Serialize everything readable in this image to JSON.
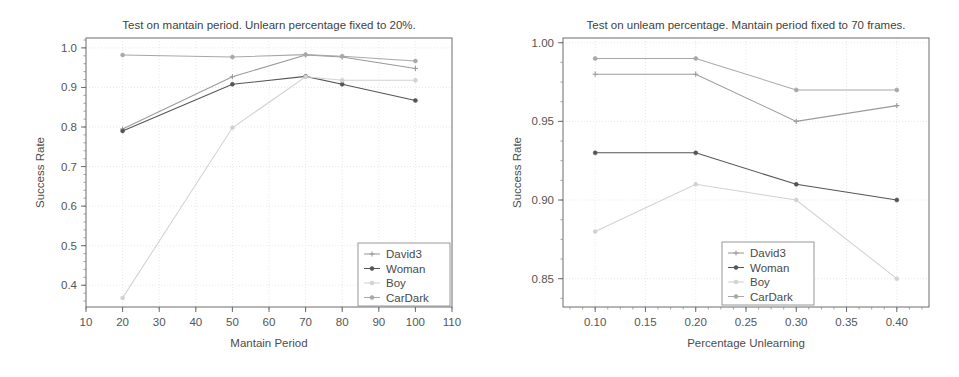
{
  "figure": {
    "background": "#ffffff",
    "panel_count": 2
  },
  "chart_data": [
    {
      "id": "left-panel",
      "type": "line",
      "title": "Test on mantain period. Unlearn percentage fixed to 20%.",
      "xlabel": "Mantain Period",
      "ylabel": "Success Rate",
      "xlim": [
        10,
        110
      ],
      "ylim": [
        0.345,
        1.025
      ],
      "xticks": [
        10,
        20,
        30,
        40,
        50,
        60,
        70,
        80,
        90,
        100,
        110
      ],
      "xticklabels": [
        "10",
        "20",
        "30",
        "40",
        "50",
        "60",
        "70",
        "80",
        "90",
        "100",
        "110"
      ],
      "yticks": [
        0.4,
        0.5,
        0.6,
        0.7,
        0.8,
        0.9,
        1.0
      ],
      "yticklabels": [
        "0.4",
        "0.5",
        "0.6",
        "0.7",
        "0.8",
        "0.9",
        "1.0"
      ],
      "grid": true,
      "legend_position": "lower right",
      "x": [
        20,
        50,
        70,
        80,
        100
      ],
      "series": [
        {
          "name": "David3",
          "color": "#9a9a9a",
          "marker": "plus",
          "values": [
            0.795,
            0.927,
            0.982,
            0.977,
            0.948
          ]
        },
        {
          "name": "Woman",
          "color": "#555555",
          "marker": "dot",
          "values": [
            0.79,
            0.908,
            0.928,
            0.908,
            0.867
          ]
        },
        {
          "name": "Boy",
          "color": "#d2d2d2",
          "marker": "dot",
          "values": [
            0.368,
            0.798,
            0.927,
            0.918,
            0.918
          ]
        },
        {
          "name": "CarDark",
          "color": "#a8a8a8",
          "marker": "dot",
          "values": [
            0.982,
            0.977,
            0.983,
            0.979,
            0.967
          ]
        }
      ]
    },
    {
      "id": "right-panel",
      "type": "line",
      "title": "Test on unleam percentage. Mantain period fixed to 70 frames.",
      "xlabel": "Percentage Unlearning",
      "ylabel": "Success Rate",
      "xlim": [
        0.068,
        0.432
      ],
      "ylim": [
        0.832,
        1.003
      ],
      "xticks": [
        0.1,
        0.15,
        0.2,
        0.25,
        0.3,
        0.35,
        0.4
      ],
      "xticklabels": [
        "0.10",
        "0.15",
        "0.20",
        "0.25",
        "0.30",
        "0.35",
        "0.40"
      ],
      "yticks": [
        0.85,
        0.9,
        0.95,
        1.0
      ],
      "yticklabels": [
        "0.85",
        "0.90",
        "0.95",
        "1.00"
      ],
      "grid": true,
      "legend_position": "lower right",
      "x": [
        0.1,
        0.2,
        0.3,
        0.4
      ],
      "series": [
        {
          "name": "David3",
          "color": "#9a9a9a",
          "marker": "plus",
          "values": [
            0.98,
            0.98,
            0.95,
            0.96
          ]
        },
        {
          "name": "Woman",
          "color": "#555555",
          "marker": "dot",
          "values": [
            0.93,
            0.93,
            0.91,
            0.9
          ]
        },
        {
          "name": "Boy",
          "color": "#d2d2d2",
          "marker": "dot",
          "values": [
            0.88,
            0.91,
            0.9,
            0.85
          ]
        },
        {
          "name": "CarDark",
          "color": "#a8a8a8",
          "marker": "dot",
          "values": [
            0.99,
            0.99,
            0.97,
            0.97
          ]
        }
      ]
    }
  ]
}
